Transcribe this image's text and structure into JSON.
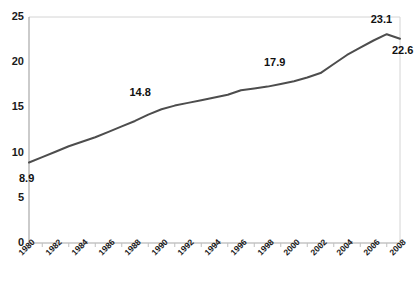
{
  "chart_data": {
    "type": "line",
    "title": "",
    "xlabel": "",
    "ylabel": "",
    "xlim": [
      1980,
      2008
    ],
    "ylim": [
      0,
      25
    ],
    "grid": false,
    "legend": "none",
    "line_color": "#4d4d4d",
    "axis_color": "#b3b3b3",
    "text_color": "#1a1a1a",
    "ytick_labels": [
      "25",
      "20",
      "15",
      "10",
      "5",
      "0"
    ],
    "ytick_values": [
      25,
      20,
      15,
      10,
      5,
      0
    ],
    "xtick_labels": [
      "1980",
      "1982",
      "1984",
      "1986",
      "1988",
      "1990",
      "1992",
      "1994",
      "1996",
      "1998",
      "2000",
      "2002",
      "2004",
      "2006",
      "2008"
    ],
    "xtick_values": [
      1980,
      1982,
      1984,
      1986,
      1988,
      1990,
      1992,
      1994,
      1996,
      1998,
      2000,
      2002,
      2004,
      2006,
      2008
    ],
    "x": [
      1980,
      1981,
      1982,
      1983,
      1984,
      1985,
      1986,
      1987,
      1988,
      1989,
      1990,
      1991,
      1992,
      1993,
      1994,
      1995,
      1996,
      1997,
      1998,
      1999,
      2000,
      2001,
      2002,
      2003,
      2004,
      2005,
      2006,
      2007,
      2008
    ],
    "values": [
      8.9,
      9.5,
      10.1,
      10.7,
      11.2,
      11.7,
      12.3,
      12.9,
      13.5,
      14.2,
      14.8,
      15.2,
      15.5,
      15.8,
      16.1,
      16.4,
      16.9,
      17.1,
      17.3,
      17.6,
      17.9,
      18.3,
      18.8,
      19.8,
      20.8,
      21.6,
      22.4,
      23.1,
      22.6
    ],
    "annotations": [
      {
        "label": "8.9",
        "year": 1980,
        "value": 8.9
      },
      {
        "label": "14.8",
        "year": 1990,
        "value": 14.8
      },
      {
        "label": "17.9",
        "year": 2000,
        "value": 17.9
      },
      {
        "label": "23.1",
        "year": 2007,
        "value": 23.1
      },
      {
        "label": "22.6",
        "year": 2008,
        "value": 22.6
      }
    ]
  }
}
